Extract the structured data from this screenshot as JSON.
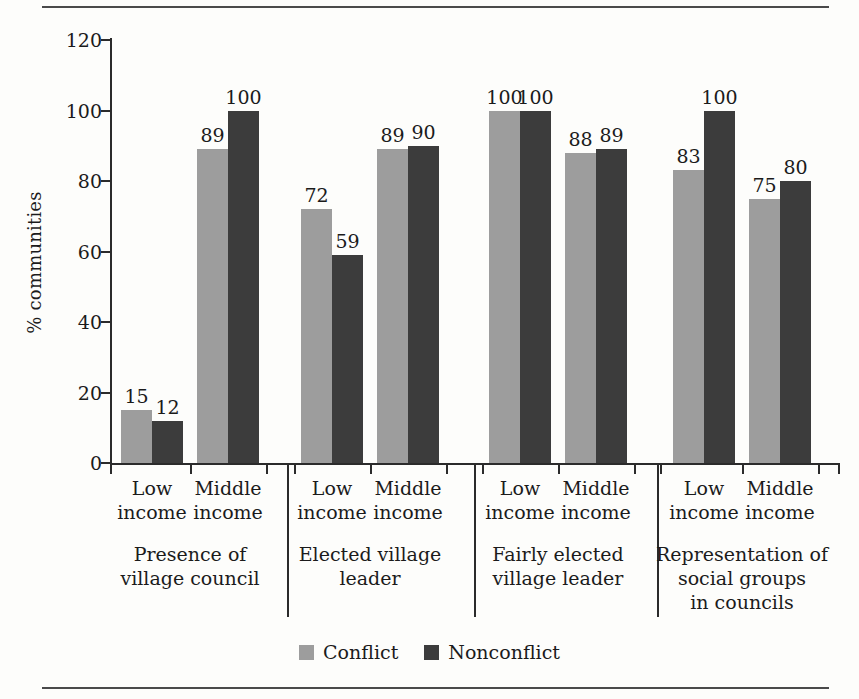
{
  "chart_data": {
    "type": "bar",
    "title": "",
    "xlabel": "",
    "ylabel": "% communities",
    "ylim": [
      0,
      120
    ],
    "yticks": [
      0,
      20,
      40,
      60,
      80,
      100,
      120
    ],
    "ytick_labels": [
      "0",
      "20",
      "40",
      "60",
      "80",
      "100",
      "120"
    ],
    "grid": false,
    "legend_position": "bottom",
    "categories": [
      "Low income",
      "Middle income",
      "Low income",
      "Middle income",
      "Low income",
      "Middle income",
      "Low income",
      "Middle income"
    ],
    "groups": [
      {
        "title": "Presence of village council",
        "title_lines": [
          "Presence of",
          "village council"
        ]
      },
      {
        "title": "Elected village leader",
        "title_lines": [
          "Elected village",
          "leader"
        ]
      },
      {
        "title": "Fairly elected village leader",
        "title_lines": [
          "Fairly elected",
          "village leader"
        ]
      },
      {
        "title": "Representation of social groups in councils",
        "title_lines": [
          "Representation of",
          "social groups",
          "in councils"
        ]
      }
    ],
    "category_lines": [
      [
        "Low",
        "income"
      ],
      [
        "Middle",
        "income"
      ],
      [
        "Low",
        "income"
      ],
      [
        "Middle",
        "income"
      ],
      [
        "Low",
        "income"
      ],
      [
        "Middle",
        "income"
      ],
      [
        "Low",
        "income"
      ],
      [
        "Middle",
        "income"
      ]
    ],
    "series": [
      {
        "name": "Conflict",
        "color": "#9d9d9d",
        "values": [
          15,
          89,
          72,
          89,
          100,
          88,
          83,
          75
        ]
      },
      {
        "name": "Nonconflict",
        "color": "#3c3c3c",
        "values": [
          12,
          100,
          59,
          90,
          100,
          89,
          100,
          80
        ]
      }
    ]
  },
  "legend": {
    "items": [
      {
        "label": "Conflict",
        "color": "#9d9d9d"
      },
      {
        "label": "Nonconflict",
        "color": "#3c3c3c"
      }
    ]
  }
}
